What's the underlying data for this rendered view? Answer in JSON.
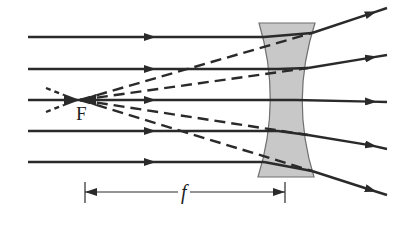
{
  "diagram": {
    "labels": {
      "focal_point": "F",
      "focal_length": "f"
    },
    "colors": {
      "ray": "#2a2a2a",
      "lens_fill": "#c8c8c8",
      "lens_stroke": "#6f6f6f",
      "background": "#ffffff"
    },
    "lens": {
      "type": "concave (diverging)",
      "top_y": 23,
      "bottom_y": 177,
      "outer_left_x": 259,
      "outer_right_x": 315,
      "waist_left_x": 276,
      "waist_right_x": 296
    },
    "focal_point": {
      "x": 80,
      "y": 100
    },
    "rays": [
      {
        "name": "ray-1",
        "start": [
          28,
          37
        ],
        "lens_exit": [
          312,
          33
        ],
        "end": [
          387,
          8
        ]
      },
      {
        "name": "ray-2",
        "start": [
          28,
          69
        ],
        "lens_exit": [
          308,
          68
        ],
        "end": [
          387,
          55
        ]
      },
      {
        "name": "ray-3",
        "start": [
          28,
          100
        ],
        "lens_exit": [
          296,
          100
        ],
        "end": [
          387,
          102
        ]
      },
      {
        "name": "ray-4",
        "start": [
          28,
          131
        ],
        "lens_exit": [
          308,
          135
        ],
        "end": [
          387,
          149
        ]
      },
      {
        "name": "ray-5",
        "start": [
          28,
          162
        ],
        "lens_exit": [
          312,
          171
        ],
        "end": [
          387,
          195
        ]
      }
    ],
    "focal_length_dimension": {
      "x_start": 85,
      "x_end": 285,
      "y": 192
    }
  }
}
